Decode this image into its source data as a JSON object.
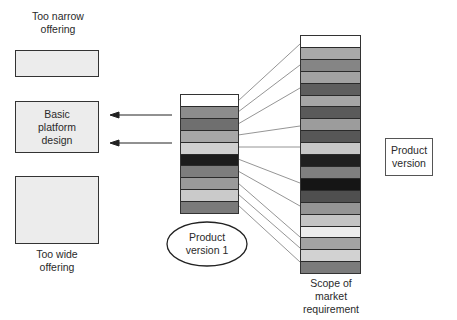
{
  "labels": {
    "too_narrow": "Too narrow offering",
    "basic_platform": "Basic platform design",
    "too_wide": "Too wide offering",
    "product_version_1": "Product version 1",
    "scope_of_market": "Scope of market requirement",
    "product_version": "Product version"
  },
  "small_column": {
    "segments": [
      "#ffffff",
      "#8c8c8c",
      "#6f6f6f",
      "#a7a7a7",
      "#d0d0d0",
      "#1c1c1c",
      "#7d7d7d",
      "#9a9a9a",
      "#cacaca",
      "#7a7a7a"
    ]
  },
  "tall_column": {
    "segments": [
      "#ffffff",
      "#a9a9a9",
      "#858585",
      "#a2a2a2",
      "#5e5e5e",
      "#a6a6a6",
      "#5a5a5a",
      "#9c9c9c",
      "#575757",
      "#c7c7c7",
      "#1f1f1f",
      "#7f7f7f",
      "#151515",
      "#4f4f4f",
      "#949494",
      "#c4c4c4",
      "#ececec",
      "#a3a3a3",
      "#d2d2d2",
      "#7b7b7b"
    ]
  },
  "connectors": [
    [
      238,
      101,
      300,
      44
    ],
    [
      238,
      112,
      300,
      65
    ],
    [
      238,
      124,
      300,
      88
    ],
    [
      238,
      135,
      300,
      126
    ],
    [
      238,
      147,
      300,
      147
    ],
    [
      238,
      159,
      300,
      183
    ],
    [
      238,
      171,
      300,
      206
    ],
    [
      238,
      183,
      300,
      237
    ],
    [
      238,
      194,
      300,
      248
    ],
    [
      238,
      205,
      300,
      262
    ]
  ],
  "arrows": [
    {
      "x1": 172,
      "y": 115,
      "x2": 110
    },
    {
      "x1": 172,
      "y": 143,
      "x2": 110
    }
  ]
}
